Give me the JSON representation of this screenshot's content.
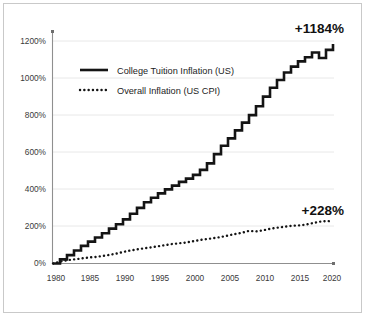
{
  "chart_data": {
    "type": "line",
    "title": "",
    "subtitle": "",
    "xlabel": "",
    "ylabel": "",
    "xlim": [
      1980,
      2020
    ],
    "ylim": [
      0,
      1250
    ],
    "grid": true,
    "legend_position": "inside-upper-left",
    "x_ticks": [
      "1980",
      "1985",
      "1990",
      "1995",
      "2000",
      "2005",
      "2010",
      "2015",
      "2020"
    ],
    "x_tick_values": [
      1980,
      1985,
      1990,
      1995,
      2000,
      2005,
      2010,
      2015,
      2020
    ],
    "y_ticks": [
      "0%",
      "200%",
      "400%",
      "600%",
      "800%",
      "1000%",
      "1200%"
    ],
    "y_tick_values": [
      0,
      200,
      400,
      600,
      800,
      1000,
      1200
    ],
    "x": [
      1980,
      1981,
      1982,
      1983,
      1984,
      1985,
      1986,
      1987,
      1988,
      1989,
      1990,
      1991,
      1992,
      1993,
      1994,
      1995,
      1996,
      1997,
      1998,
      1999,
      2000,
      2001,
      2002,
      2003,
      2004,
      2005,
      2006,
      2007,
      2008,
      2009,
      2010,
      2011,
      2012,
      2013,
      2014,
      2015,
      2016,
      2017,
      2018,
      2019,
      2020
    ],
    "series": [
      {
        "name": "College Tuition Inflation (US)",
        "style": "solid-step",
        "color": "#141414",
        "end_label": "+1184%",
        "values": [
          0,
          22,
          45,
          70,
          95,
          118,
          140,
          163,
          188,
          212,
          238,
          268,
          300,
          330,
          355,
          378,
          400,
          420,
          440,
          458,
          478,
          505,
          540,
          590,
          635,
          675,
          718,
          760,
          800,
          848,
          900,
          948,
          990,
          1030,
          1062,
          1090,
          1112,
          1138,
          1108,
          1152,
          1184
        ]
      },
      {
        "name": "Overall Inflation (US CPI)",
        "style": "dotted",
        "color": "#141414",
        "end_label": "+228%",
        "values": [
          0,
          10,
          18,
          22,
          27,
          32,
          35,
          40,
          46,
          53,
          62,
          70,
          76,
          82,
          87,
          93,
          99,
          105,
          109,
          113,
          120,
          127,
          132,
          137,
          143,
          151,
          159,
          166,
          176,
          173,
          179,
          187,
          193,
          198,
          203,
          205,
          209,
          217,
          225,
          229,
          228
        ]
      }
    ],
    "annotations": [
      {
        "text": "+1184%",
        "series": "College Tuition Inflation (US)",
        "x": 2020,
        "y": 1184
      },
      {
        "text": "+228%",
        "series": "Overall Inflation (US CPI)",
        "x": 2020,
        "y": 228
      }
    ],
    "legend": [
      {
        "label": "College Tuition Inflation (US)",
        "style": "solid"
      },
      {
        "label": "Overall Inflation (US CPI)",
        "style": "dotted"
      }
    ]
  }
}
